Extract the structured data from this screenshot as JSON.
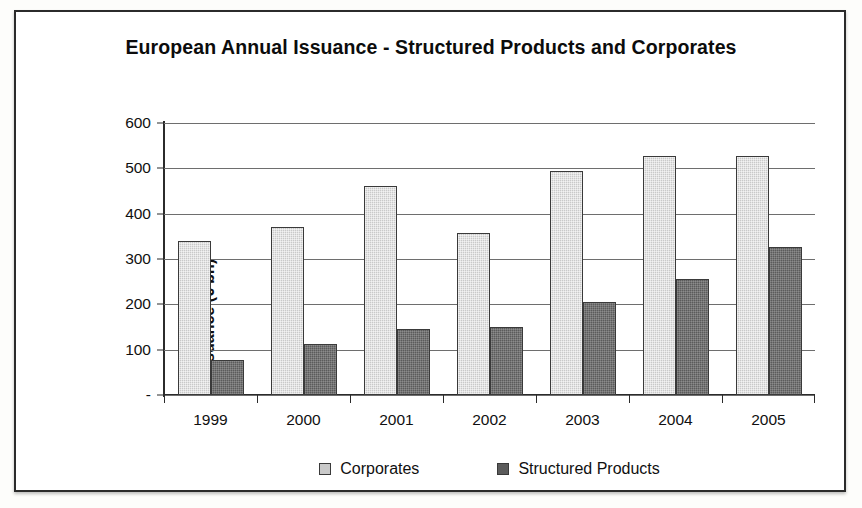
{
  "chart_data": {
    "type": "bar",
    "title": "European Annual Issuance - Structured Products and Corporates",
    "xlabel": "",
    "ylabel": "Issuance (€ bn)",
    "categories": [
      "1999",
      "2000",
      "2001",
      "2002",
      "2003",
      "2004",
      "2005"
    ],
    "series": [
      {
        "name": "Corporates",
        "color": "#c9c9c9",
        "values": [
          340,
          370,
          460,
          358,
          495,
          528,
          528
        ]
      },
      {
        "name": "Structured Products",
        "color": "#5b5b5b",
        "values": [
          78,
          113,
          145,
          150,
          205,
          257,
          327
        ]
      }
    ],
    "ylim": [
      0,
      600
    ],
    "y_ticks": [
      0,
      100,
      200,
      300,
      400,
      500,
      600
    ],
    "y_tick_labels": [
      "-",
      "100",
      "200",
      "300",
      "400",
      "500",
      "600"
    ],
    "grid": true,
    "legend_position": "bottom"
  },
  "legend": {
    "items": [
      {
        "label": "Corporates",
        "swatch": "corporates"
      },
      {
        "label": "Structured Products",
        "swatch": "structured"
      }
    ]
  }
}
